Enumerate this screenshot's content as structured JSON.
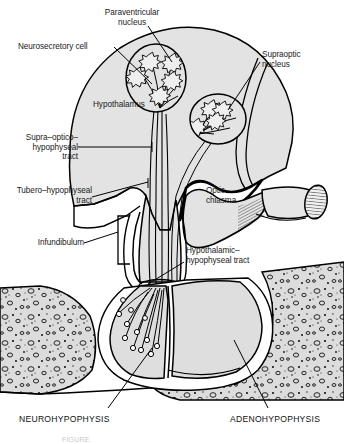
{
  "figure": {
    "type": "anatomical-diagram",
    "width": 344,
    "height": 444,
    "background": "#ffffff",
    "line_color": "#000000",
    "fills": {
      "brain_tissue": "#e2e2e2",
      "pituitary": "#dcdcdc",
      "bone": "#dadada",
      "cavity": "#ffffff",
      "optic_nerve_cut": "#e8e8e8"
    }
  },
  "labels": {
    "paraventricular_nucleus": "Paraventricular\nnucleus",
    "neurosecretory_cell": "Neurosecretory cell",
    "supraoptic_nucleus": "Supraoptic\nnucleus",
    "hypothalamus": "Hypothalamus",
    "supra_optico_hypophyseal_tract": "Supra–optico–\nhypophyseal\ntract",
    "tubero_hypophyseal_tract": "Tubero–hypophyseal\ntract",
    "infundibulum": "Infundibulum",
    "optic_chiasma": "Optic\nchiasma",
    "hypothalamic_hypophyseal_tract": "Hypothalamic–\nhypophyseal tract",
    "neurohypophysis": "NEUROHYPOPHYSIS",
    "adenohypophysis": "ADENOHYPOPHYSIS"
  },
  "caption": {
    "text": "FIGURE",
    "visible": "partially-cropped"
  },
  "structures": [
    {
      "name": "paraventricular-nucleus",
      "kind": "nucleus",
      "cells": 5
    },
    {
      "name": "supraoptic-nucleus",
      "kind": "nucleus",
      "cells": 5
    },
    {
      "name": "hypothalamus",
      "kind": "region"
    },
    {
      "name": "optic-chiasma",
      "kind": "region"
    },
    {
      "name": "optic-nerve",
      "kind": "nerve-cut-section"
    },
    {
      "name": "infundibulum",
      "kind": "stalk"
    },
    {
      "name": "neurohypophysis",
      "kind": "posterior-pituitary-lobe"
    },
    {
      "name": "adenohypophysis",
      "kind": "anterior-pituitary-lobe"
    },
    {
      "name": "sphenoid-bone",
      "kind": "bone-stippled"
    }
  ]
}
